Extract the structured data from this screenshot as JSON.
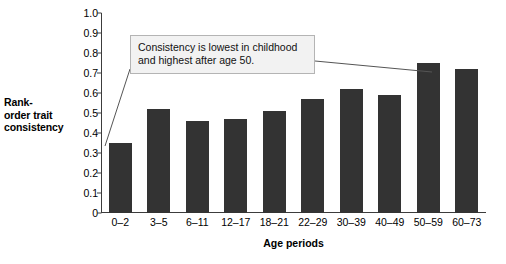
{
  "chart_data": {
    "type": "bar",
    "title": "",
    "subtitle": "",
    "xlabel": "Age periods",
    "ylabel": "Rank-order trait consistency",
    "categories": [
      "0–2",
      "3–5",
      "6–11",
      "12–17",
      "18–21",
      "22–29",
      "30–39",
      "40–49",
      "50–59",
      "60–73"
    ],
    "values": [
      0.35,
      0.52,
      0.46,
      0.47,
      0.51,
      0.57,
      0.62,
      0.59,
      0.75,
      0.72
    ],
    "ylim": [
      0,
      1.0
    ],
    "ytick_values": [
      0,
      0.1,
      0.2,
      0.3,
      0.4,
      0.5,
      0.6,
      0.7,
      0.8,
      0.9,
      1.0
    ],
    "ytick_labels": [
      "0",
      "0.1",
      "0.2",
      "0.3",
      "0.4",
      "0.5",
      "0.6",
      "0.7",
      "0.8",
      "0.9",
      "1.0"
    ],
    "grid": false,
    "legend": null,
    "bar_color": "#333333",
    "annotations": [
      {
        "text": "Consistency is lowest in childhood and highest after age 50.",
        "points_to": [
          "0–2",
          "50–59"
        ]
      }
    ]
  },
  "axis": {
    "y_title_lines": [
      "Rank-",
      "order trait",
      "consistency"
    ],
    "x_title": "Age periods"
  },
  "annotation": {
    "line1": "Consistency is lowest in childhood",
    "line2": "and highest after age 50."
  },
  "colors": {
    "bar": "#333333",
    "axis": "#3c3c3c",
    "callout_bg": "#f2f2f2",
    "callout_border": "#b4b4b4",
    "leader": "#555555",
    "background": "#ffffff"
  }
}
